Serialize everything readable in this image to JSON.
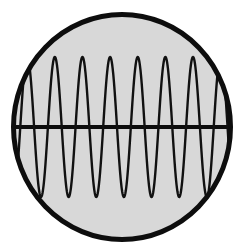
{
  "figure": {
    "background_color": "#ffffff",
    "width": 242,
    "height": 251
  },
  "circle": {
    "name": "circle-disc",
    "center_x": 122,
    "center_y": 127,
    "radius_x": 111,
    "radius_y": 115,
    "fill_color": "#d8d8d8",
    "stroke_color": "#0d0d0d",
    "stroke_width": 5
  },
  "axis": {
    "name": "horizontal-axis-line",
    "y": 127,
    "x_start": 11,
    "x_end": 233,
    "stroke_color": "#0d0d0d",
    "stroke_width": 4
  },
  "chart_data": {
    "type": "line",
    "xlabel": "",
    "ylabel": "",
    "series": [
      {
        "name": "sine-wave",
        "waveform": "sine",
        "cycles": 8.25,
        "amplitude": 70,
        "baseline_y": 127,
        "peak_y": 57,
        "trough_y": 197,
        "phase_degrees": 200,
        "x_start": 11,
        "x_end": 233,
        "stroke_color": "#111111",
        "stroke_width": 2.4,
        "fill": "none"
      }
    ],
    "axis_lines": [
      {
        "orientation": "horizontal",
        "value": 127
      }
    ],
    "ylim": [
      197,
      57
    ],
    "xlim": [
      11,
      233
    ],
    "grid": false,
    "legend": false
  },
  "labels": {
    "none": ""
  }
}
